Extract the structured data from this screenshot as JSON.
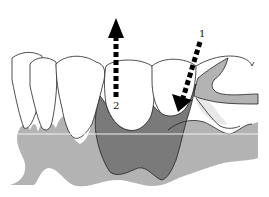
{
  "figure": {
    "labels": {
      "arrow1": "1",
      "arrow2": "2"
    },
    "colors": {
      "tooth_fill": "#ffffff",
      "outline": "#222222",
      "bone_light": "#b3b3b3",
      "tissue_dark": "#7a7a7a",
      "gum_faint": "#e8e8e8",
      "arrow": "#000000",
      "horizontal_line": "#f2f2f2"
    }
  }
}
